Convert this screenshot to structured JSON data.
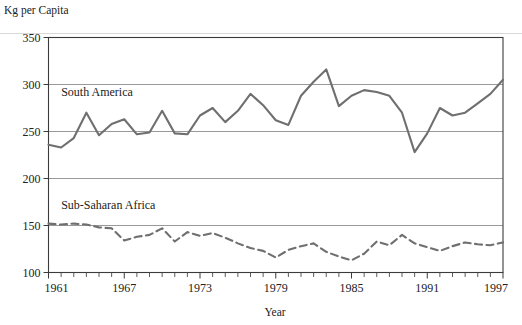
{
  "chart_data": {
    "type": "line",
    "title": "",
    "ylabel": "Kg per Capita",
    "xlabel": "Year",
    "ylim": [
      100,
      350
    ],
    "xlim": [
      1961,
      1997
    ],
    "yticks": [
      100,
      150,
      200,
      250,
      300,
      350
    ],
    "xticks": [
      1961,
      1967,
      1973,
      1979,
      1985,
      1991,
      1997
    ],
    "xtick_labels": [
      "1961",
      "1967",
      "1973",
      "1979",
      "1985",
      "1991",
      "1997"
    ],
    "ytick_labels": [
      "100",
      "150",
      "200",
      "250",
      "300",
      "350"
    ],
    "minor_xticks_every": 1,
    "grid": "horizontal",
    "legend": "inline-labels",
    "x": [
      1961,
      1962,
      1963,
      1964,
      1965,
      1966,
      1967,
      1968,
      1969,
      1970,
      1971,
      1972,
      1973,
      1974,
      1975,
      1976,
      1977,
      1978,
      1979,
      1980,
      1981,
      1982,
      1983,
      1984,
      1985,
      1986,
      1987,
      1988,
      1989,
      1990,
      1991,
      1992,
      1993,
      1994,
      1995,
      1996,
      1997
    ],
    "series": [
      {
        "name": "South America",
        "style": "solid",
        "color": "#6f6f6f",
        "label_x": 1962,
        "label_y": 288,
        "values": [
          236,
          233,
          243,
          270,
          246,
          258,
          263,
          247,
          249,
          272,
          248,
          247,
          267,
          275,
          260,
          272,
          290,
          278,
          262,
          257,
          288,
          303,
          316,
          277,
          288,
          294,
          292,
          288,
          270,
          228,
          248,
          275,
          267,
          270,
          280,
          290,
          305
        ]
      },
      {
        "name": "Sub-Saharan Africa",
        "style": "dashed",
        "color": "#6f6f6f",
        "label_x": 1962,
        "label_y": 168,
        "values": [
          152,
          151,
          152,
          151,
          148,
          147,
          134,
          138,
          140,
          147,
          133,
          143,
          139,
          142,
          137,
          131,
          126,
          123,
          116,
          124,
          128,
          131,
          122,
          117,
          113,
          120,
          133,
          129,
          140,
          131,
          127,
          123,
          128,
          132,
          130,
          129,
          132
        ]
      }
    ]
  }
}
